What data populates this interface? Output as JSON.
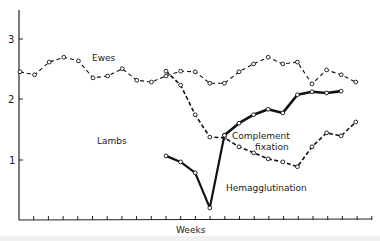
{
  "chart_data": {
    "type": "line",
    "title": "",
    "xlabel": "Weeks",
    "ylabel": "",
    "ylim": [
      0,
      3.5
    ],
    "yticks": [
      1,
      2,
      3
    ],
    "x_ticks_count": 24,
    "grid": false,
    "legend": "inline labels",
    "annotations": [
      "Ewes",
      "Lambs",
      "Complement fixation",
      "Hemagglutination"
    ],
    "series": [
      {
        "name": "Ewes",
        "style": "dashed, open circles",
        "x": [
          0,
          1,
          2,
          3,
          4,
          5,
          6,
          7,
          8,
          9,
          10,
          11,
          12,
          13,
          14,
          15,
          16,
          17,
          18,
          19,
          20,
          21,
          22,
          23
        ],
        "values": [
          2.45,
          2.4,
          2.61,
          2.69,
          2.63,
          2.35,
          2.38,
          2.5,
          2.31,
          2.28,
          2.38,
          2.46,
          2.45,
          2.26,
          2.26,
          2.45,
          2.58,
          2.69,
          2.58,
          2.61,
          2.25,
          2.48,
          2.4,
          2.28
        ]
      },
      {
        "name": "Lambs",
        "style": "dashed, open circles",
        "x": [
          10,
          11,
          12,
          13,
          14,
          15,
          16,
          17,
          18,
          19,
          20,
          21,
          22,
          23
        ],
        "values": [
          2.46,
          2.23,
          1.74,
          1.37,
          1.36,
          1.21,
          1.11,
          1.01,
          0.96,
          0.88,
          1.21,
          1.44,
          1.39,
          1.62
        ]
      },
      {
        "name": "Hemagglutination",
        "style": "solid bold, open circles",
        "x": [
          10,
          11,
          12,
          13,
          14
        ],
        "values": [
          1.06,
          0.96,
          0.78,
          0.2,
          1.4
        ]
      },
      {
        "name": "Complement fixation",
        "style": "solid bold, open circles",
        "x": [
          14,
          15,
          16,
          17,
          18,
          19,
          20,
          21,
          22
        ],
        "values": [
          1.4,
          1.6,
          1.74,
          1.83,
          1.77,
          2.07,
          2.12,
          2.1,
          2.13
        ]
      }
    ]
  },
  "labels": {
    "ewes": "Ewes",
    "lambs": "Lambs",
    "complement_line1": "Complement",
    "complement_line2": "fixation",
    "hemagglutination": "Hemagglutination",
    "x_axis": "Weeks",
    "y_tick_1": "1",
    "y_tick_2": "2",
    "y_tick_3": "3"
  }
}
